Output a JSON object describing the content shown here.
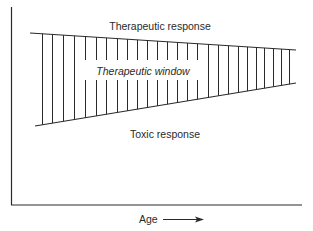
{
  "diagram": {
    "type": "therapeutic-window",
    "labels": {
      "top": "Therapeutic response",
      "middle": "Therapeutic window",
      "bottom": "Toxic response",
      "x_axis": "Age"
    },
    "axes": {
      "x_label": "Age",
      "x_arrow": true,
      "y_label": ""
    },
    "bands": {
      "upper_line": {
        "x1": 30,
        "y1": 33,
        "x2": 296,
        "y2": 50
      },
      "lower_line": {
        "x1": 35,
        "y1": 126,
        "x2": 296,
        "y2": 83
      },
      "hatch_x": [
        42,
        52,
        63,
        74,
        85,
        96,
        106,
        117,
        127,
        137,
        147,
        157,
        167,
        177,
        187,
        197,
        208,
        218,
        228,
        238,
        247,
        256,
        264,
        273,
        281,
        289
      ],
      "text_gap": {
        "x_from": 84,
        "x_to": 198,
        "y_top": 60,
        "y_bottom": 80
      }
    },
    "colors": {
      "line": "#2a2a2a",
      "background": "#ffffff"
    }
  }
}
